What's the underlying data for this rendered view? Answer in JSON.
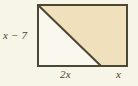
{
  "figure": {
    "type": "geometry-diagram",
    "shape": "rectangle-with-diagonal",
    "labels": {
      "height": "x − 7",
      "base_left_segment": "2x",
      "base_right_segment": "x"
    },
    "colors": {
      "background": "#f7f5e8",
      "shaded_region": "#f0e0bc",
      "unshaded_region": "#faf8ee",
      "stroke": "#4a4734"
    },
    "geometry": {
      "rect_left": 38,
      "rect_top": 5,
      "rect_right": 127,
      "rect_bottom": 66,
      "diagonal_start_x": 38,
      "diagonal_start_y": 5,
      "diagonal_end_x": 101,
      "diagonal_end_y": 66
    }
  }
}
